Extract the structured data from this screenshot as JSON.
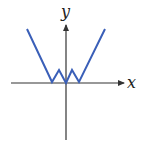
{
  "chart_data": {
    "type": "line",
    "title": "",
    "xlabel": "x",
    "ylabel": "y",
    "grid": false,
    "axes": {
      "x_axis": {
        "label": "x",
        "arrow": "right"
      },
      "y_axis": {
        "label": "y",
        "arrow": "up"
      }
    },
    "series": [
      {
        "name": "curve",
        "color": "#3a5fb8",
        "points_px": [
          [
            27,
            29
          ],
          [
            52,
            82
          ],
          [
            59,
            70
          ],
          [
            66,
            83
          ],
          [
            72,
            70
          ],
          [
            79,
            82
          ],
          [
            105,
            29
          ]
        ]
      }
    ]
  },
  "labels": {
    "x": "x",
    "y": "y"
  },
  "colors": {
    "curve": "#3a5fb8",
    "axis": "#333333"
  }
}
